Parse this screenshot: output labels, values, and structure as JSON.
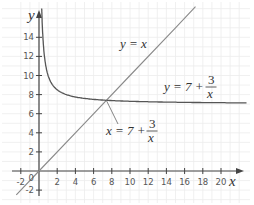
{
  "chart_data": {
    "type": "line",
    "title": "",
    "xlabel": "x",
    "ylabel": "y",
    "xlim": [
      -2.5,
      21.5
    ],
    "ylim": [
      -2.5,
      17
    ],
    "x_ticks": [
      -2,
      2,
      4,
      6,
      8,
      10,
      12,
      14,
      16,
      18,
      20
    ],
    "y_ticks": [
      -2,
      2,
      4,
      6,
      8,
      10,
      12,
      14
    ],
    "origin_label": "0",
    "grid": true,
    "series": [
      {
        "name": "y = x",
        "equation": "y = x",
        "x": [
          -2.5,
          0,
          5,
          10,
          15,
          17.2
        ],
        "y": [
          -2.5,
          0,
          5,
          10,
          15,
          17.2
        ]
      },
      {
        "name": "y = 7 + 3/x",
        "equation": "y = 7 + 3/x",
        "x": [
          0.3,
          0.5,
          1,
          2,
          3,
          5,
          7.4,
          10,
          15,
          20,
          22.8
        ],
        "y": [
          17,
          13,
          10,
          8.5,
          8,
          7.6,
          7.4,
          7.3,
          7.2,
          7.15,
          7.13
        ]
      }
    ],
    "annotations": [
      {
        "text": "y = x",
        "x": 9,
        "y": 14
      },
      {
        "text": "y = 7 + 3/x",
        "x": 17,
        "y": 10
      },
      {
        "text": "x = 7 + 3/x",
        "x": 10,
        "y": 3.5,
        "points_to": [
          7.4,
          7.4
        ]
      }
    ]
  },
  "labels": {
    "x_axis": "x",
    "y_axis": "y",
    "origin": "0",
    "eq_line_lhs": "y = x",
    "eq_curve_lhs": "y = 7 + ",
    "eq_intersect_lhs": "x = 7 + ",
    "frac_num": "3",
    "frac_den": "x",
    "ticks_x": [
      "-2",
      "2",
      "4",
      "6",
      "8",
      "10",
      "12",
      "14",
      "16",
      "18",
      "20"
    ],
    "ticks_y": [
      "-2",
      "2",
      "4",
      "6",
      "8",
      "10",
      "12",
      "14"
    ]
  }
}
